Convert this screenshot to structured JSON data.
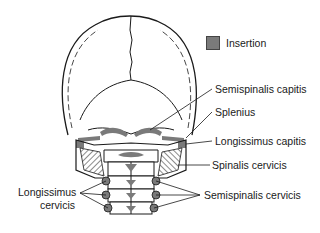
{
  "legend": {
    "label": "Insertion",
    "swatch_color": "#7a7a7a"
  },
  "labels": {
    "semispinalis_capitis": "Semispinalis capitis",
    "splenius": "Splenius",
    "longissimus_capitis": "Longissimus capitis",
    "spinalis_cervicis": "Spinalis cervicis",
    "semispinalis_cervicis": "Semispinalis cervicis",
    "longissimus_cervicis_line1": "Longissimus",
    "longissimus_cervicis_line2": "cervicis"
  },
  "colors": {
    "outline": "#1a1a1a",
    "insertion": "#7a7a7a",
    "background": "#ffffff"
  }
}
